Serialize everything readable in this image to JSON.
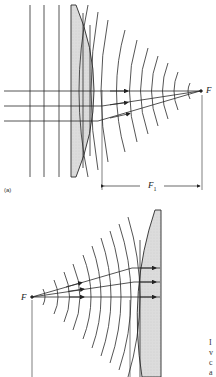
{
  "figure_a": {
    "panel_label": "(a)",
    "focal_point_label": "F",
    "focal_length_label": "F",
    "focal_length_subscript": "1",
    "lens_type": "plano-convex",
    "ray_count": 3
  },
  "figure_b": {
    "focal_point_label": "F",
    "lens_type": "plano-convex",
    "ray_count": 3
  },
  "side_text_fragments": [
    "I",
    "v",
    "c",
    "a"
  ],
  "colors": {
    "line": "#2a2a2a",
    "lens_fill": "#d8d8d8",
    "background": "#ffffff"
  }
}
